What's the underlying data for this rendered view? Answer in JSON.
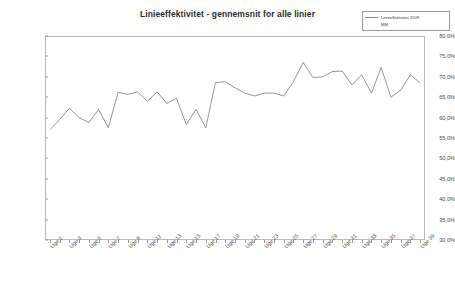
{
  "chart": {
    "title": "Linieeffektivitet - gennemsnit for alle linier",
    "legend": {
      "position": "top-right",
      "entries": [
        {
          "label": "Linieeffektivitet 2009",
          "color": "#8a8a8a",
          "has_line": true
        },
        {
          "label": "MM",
          "color": "#8a8a8a",
          "has_line": false
        }
      ]
    }
  },
  "chart_data": {
    "type": "line",
    "title": "Linieeffektivitet - gennemsnit for alle linier",
    "xlabel": "",
    "ylabel": "",
    "ylim": [
      30.0,
      80.0
    ],
    "ytick_labels": [
      "80,0%",
      "75,0%",
      "70,0%",
      "65,0%",
      "60,0%",
      "55,0%",
      "50,0%",
      "45,0%",
      "40,0%",
      "35,0%",
      "30,0%"
    ],
    "ytick_values": [
      80.0,
      75.0,
      70.0,
      65.0,
      60.0,
      55.0,
      50.0,
      45.0,
      40.0,
      35.0,
      30.0
    ],
    "grid": false,
    "xtick_labels": [
      "Uge 1",
      "Uge 3",
      "Uge 5",
      "Uge 7",
      "Uge 9",
      "Uge 11",
      "Uge 13",
      "Uge 15",
      "Uge 17",
      "Uge 19",
      "Uge 21",
      "Uge 23",
      "Uge 25",
      "Uge 27",
      "Uge 29",
      "Uge 31",
      "Uge 33",
      "Uge 35",
      "Uge 37",
      "Uge 39"
    ],
    "categories": [
      "Uge 1",
      "Uge 2",
      "Uge 3",
      "Uge 4",
      "Uge 5",
      "Uge 6",
      "Uge 7",
      "Uge 8",
      "Uge 9",
      "Uge 10",
      "Uge 11",
      "Uge 12",
      "Uge 13",
      "Uge 14",
      "Uge 15",
      "Uge 16",
      "Uge 17",
      "Uge 18",
      "Uge 19",
      "Uge 20",
      "Uge 21",
      "Uge 22",
      "Uge 23",
      "Uge 24",
      "Uge 25",
      "Uge 26",
      "Uge 27",
      "Uge 28",
      "Uge 29",
      "Uge 30",
      "Uge 31",
      "Uge 32",
      "Uge 33",
      "Uge 34",
      "Uge 35",
      "Uge 36",
      "Uge 37",
      "Uge 38",
      "Uge 39"
    ],
    "series": [
      {
        "name": "Linieeffektivitet 2009",
        "color": "#8a8a8a",
        "values": [
          57.0,
          59.5,
          62.3,
          60.0,
          58.8,
          62.0,
          57.5,
          66.2,
          65.7,
          66.3,
          64.0,
          66.3,
          63.5,
          64.7,
          58.3,
          62.0,
          57.5,
          68.6,
          68.8,
          67.3,
          66.0,
          65.3,
          66.0,
          66.0,
          65.3,
          68.8,
          73.5,
          69.8,
          70.0,
          71.3,
          71.4,
          68.0,
          70.5,
          66.0,
          72.3,
          65.0,
          66.7,
          70.5,
          68.5
        ]
      }
    ]
  }
}
